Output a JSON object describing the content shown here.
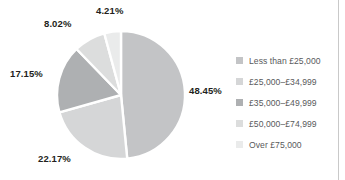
{
  "chart_data": {
    "type": "pie",
    "title": "",
    "subtitle": "",
    "xlabel": "",
    "ylabel": "",
    "grid": false,
    "legend_position": "right",
    "start_angle_deg": 0,
    "direction": "clockwise",
    "categories": [
      "Less than £25,000",
      "£25,000–£34,999",
      "£35,000–£49,999",
      "£50,000–£74,999",
      "Over £75,000"
    ],
    "values": [
      48.45,
      22.17,
      17.15,
      8.02,
      4.21
    ],
    "value_labels": [
      "48.45%",
      "22.17%",
      "17.15%",
      "8.02%",
      "4.21%"
    ],
    "colors": [
      "#c3c4c6",
      "#d5d6d7",
      "#aeb0b2",
      "#dcdddd",
      "#eaebeb"
    ],
    "units": "percent"
  },
  "legend": {
    "items": [
      {
        "label": "Less than £25,000",
        "color": "#c3c4c6"
      },
      {
        "label": "£25,000–£34,999",
        "color": "#d5d6d7"
      },
      {
        "label": "£35,000–£49,999",
        "color": "#aeb0b2"
      },
      {
        "label": "£50,000–£74,999",
        "color": "#dcdddd"
      },
      {
        "label": "Over £75,000",
        "color": "#eaebeb"
      }
    ]
  },
  "labels": {
    "slice_0": "48.45%",
    "slice_1": "22.17%",
    "slice_2": "17.15%",
    "slice_3": "8.02%",
    "slice_4": "4.21%"
  },
  "style": {
    "label_color": "#231f20",
    "legend_text_color": "#58595b",
    "divider_color": "#c9c9c9",
    "background": "#ffffff",
    "slice_gap_color": "#ffffff"
  }
}
